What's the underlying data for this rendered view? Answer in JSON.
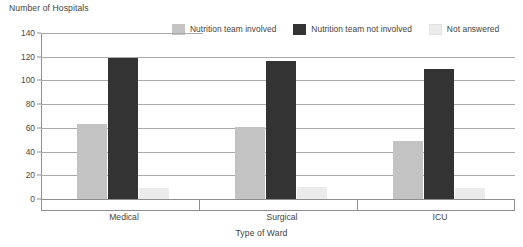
{
  "chart_data": {
    "type": "bar",
    "title": "",
    "ylabel": "Number of Hospitals",
    "xlabel": "Type of Ward",
    "categories": [
      "Medical",
      "Surgical",
      "ICU"
    ],
    "series": [
      {
        "name": "Nutrition team involved",
        "color": "#c3c3c3",
        "values": [
          63,
          61,
          49
        ]
      },
      {
        "name": "Nutrition team not involved",
        "color": "#333333",
        "values": [
          119,
          116,
          110
        ]
      },
      {
        "name": "Not answered",
        "color": "#ebebeb",
        "values": [
          9,
          10,
          9
        ]
      }
    ],
    "ylim": [
      0,
      140
    ],
    "yticks": [
      0,
      20,
      40,
      60,
      80,
      100,
      120,
      140
    ],
    "ytick_labels": [
      "0",
      "20",
      "40",
      "60",
      "80",
      "100",
      "120",
      "140"
    ],
    "grid": true,
    "grid_axis": "y",
    "legend_position": "top-center",
    "orientation": "vertical",
    "group_mode": "grouped"
  },
  "axes": {
    "y_title": "Number of Hospitals",
    "x_title": "Type of Ward"
  },
  "legend": {
    "items": [
      {
        "label": "Nutrition team involved",
        "color": "#c3c3c3"
      },
      {
        "label": "Nutrition team not involved",
        "color": "#333333"
      },
      {
        "label": "Not answered",
        "color": "#ebebeb"
      }
    ]
  },
  "colors": {
    "background": "#ffffff",
    "gridline": "#a9a9a9",
    "axis": "#8e8e8e",
    "text": "#3f3f3f",
    "series_involved": "#c3c3c3",
    "series_not_involved": "#333333",
    "series_not_answered": "#ebebeb"
  }
}
